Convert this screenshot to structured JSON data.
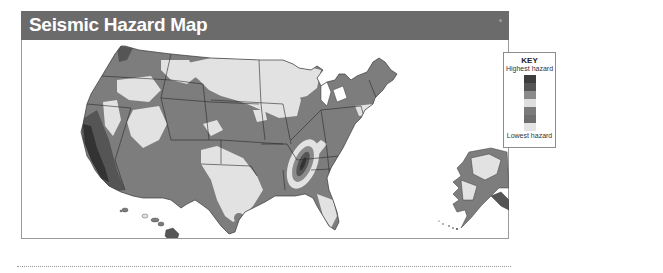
{
  "header": {
    "title": "Seismic Hazard Map"
  },
  "key": {
    "title": "KEY",
    "high_label": "Highest hazard",
    "low_label": "Lowest hazard",
    "swatches": [
      {
        "level": 7,
        "color": "#3d3d3d"
      },
      {
        "level": 6,
        "color": "#555555"
      },
      {
        "level": 5,
        "color": "#8a8a8a"
      },
      {
        "level": 4,
        "color": "#dedede"
      },
      {
        "level": 3,
        "color": "#7a7a7a"
      },
      {
        "level": 2,
        "color": "#6e6e6e"
      },
      {
        "level": 1,
        "color": "#e4e4e4"
      }
    ]
  },
  "map": {
    "regions": [
      "Contiguous United States",
      "Alaska",
      "Hawaii"
    ],
    "colors": {
      "background": "#ffffff",
      "low_hazard": "#e2e2e2",
      "moderate_hazard": "#7d7d7d",
      "high_hazard": "#555555",
      "highest_hazard": "#333333",
      "borders": "#2a2a2a"
    }
  }
}
